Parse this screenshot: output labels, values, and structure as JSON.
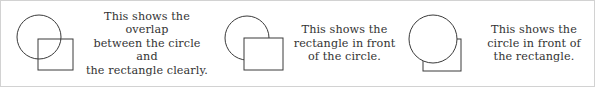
{
  "figure": {
    "border_color": "#d2d2d2",
    "background_color": "#ffffff",
    "stroke_color": "#3a3a3a",
    "text_color": "#333333"
  },
  "panels": [
    {
      "id": "overlap",
      "caption": "This shows the overlap\nbetween the circle and\nthe rectangle clearly.",
      "diagram": {
        "circle_label": "circle",
        "rectangle_label": "rectangle",
        "front_shape": "none",
        "circle_filled": false,
        "rectangle_filled": false
      }
    },
    {
      "id": "rectangle-front",
      "caption": "This shows the\nrectangle in front\nof the circle.",
      "diagram": {
        "circle_label": "circle",
        "rectangle_label": "rectangle",
        "front_shape": "rectangle",
        "circle_filled": false,
        "rectangle_filled": true
      }
    },
    {
      "id": "circle-front",
      "caption": "This shows the\ncircle in front of\nthe rectangle.",
      "diagram": {
        "circle_label": "circle",
        "rectangle_label": "rectangle",
        "front_shape": "circle",
        "circle_filled": true,
        "rectangle_filled": false
      }
    }
  ]
}
